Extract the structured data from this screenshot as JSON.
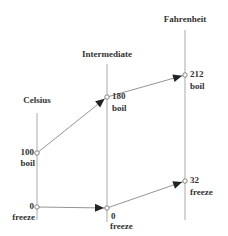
{
  "colors": {
    "axis": "#b8b8b8",
    "arrow": "#888888",
    "head": "#222222",
    "text": "#333333"
  },
  "axes": [
    {
      "id": "celsius",
      "title": "Celsius",
      "x": 37,
      "y1": 113,
      "y2": 220,
      "title_y": 103,
      "points": [
        {
          "value": "100",
          "tag": "boil",
          "y": 153,
          "label_side": "left"
        },
        {
          "value": "0",
          "tag": "freeze",
          "y": 207,
          "label_side": "left"
        }
      ]
    },
    {
      "id": "intermediate",
      "title": "Intermediate",
      "x": 107,
      "y1": 64,
      "y2": 222,
      "title_y": 57,
      "points": [
        {
          "value": "180",
          "tag": "boil",
          "y": 97,
          "label_side": "right"
        },
        {
          "value": "0",
          "tag": "freeze",
          "y": 208,
          "label_side": "right-below"
        }
      ]
    },
    {
      "id": "fahrenheit",
      "title": "Fahrenheit",
      "x": 185,
      "y1": 30,
      "y2": 220,
      "title_y": 22,
      "points": [
        {
          "value": "212",
          "tag": "boil",
          "y": 75,
          "label_side": "right"
        },
        {
          "value": "32",
          "tag": "freeze",
          "y": 181,
          "label_side": "right"
        }
      ]
    }
  ],
  "arrows": [
    {
      "from": [
        37,
        153
      ],
      "to": [
        107,
        97
      ]
    },
    {
      "from": [
        107,
        97
      ],
      "to": [
        185,
        75
      ]
    },
    {
      "from": [
        37,
        207
      ],
      "to": [
        107,
        208
      ]
    },
    {
      "from": [
        107,
        208
      ],
      "to": [
        185,
        181
      ]
    }
  ]
}
